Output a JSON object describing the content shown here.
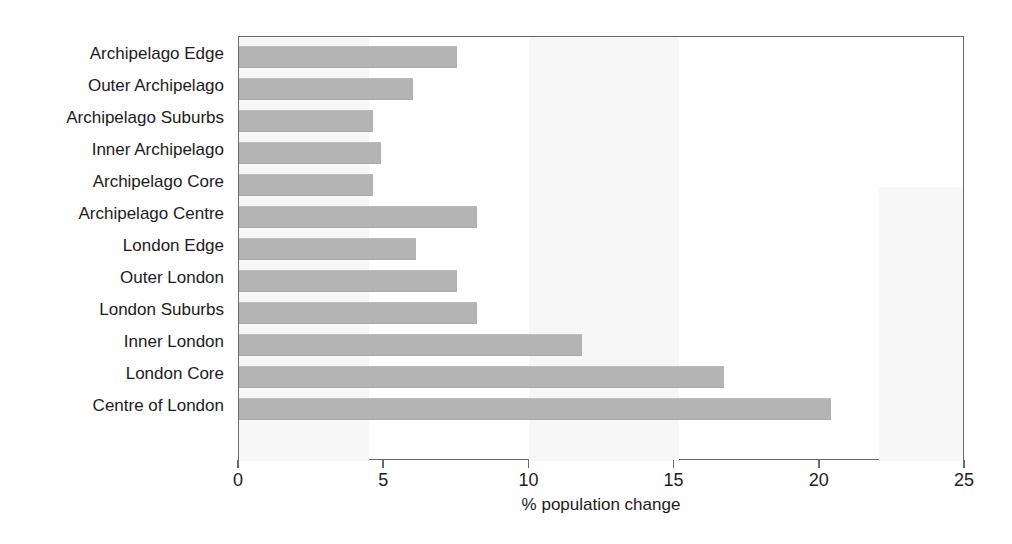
{
  "chart_data": {
    "type": "bar",
    "orientation": "horizontal",
    "title": "",
    "xlabel": "% population change",
    "ylabel": "",
    "xlim": [
      0,
      25
    ],
    "xticks": [
      0,
      5,
      10,
      15,
      20,
      25
    ],
    "xtick_labels": [
      "0",
      "5",
      "10",
      "15",
      "20",
      "25"
    ],
    "grid": false,
    "legend": false,
    "bar_color": "#b4b4b4",
    "categories": [
      "Archipelago Edge",
      "Outer Archipelago",
      "Archipelago Suburbs",
      "Inner Archipelago",
      "Archipelago Core",
      "Archipelago Centre",
      "London Edge",
      "Outer London",
      "London Suburbs",
      "Inner London",
      "London Core",
      "Centre of London"
    ],
    "values": [
      7.5,
      6.0,
      4.6,
      4.9,
      4.6,
      8.2,
      6.1,
      7.5,
      8.2,
      11.8,
      16.7,
      20.4
    ]
  }
}
